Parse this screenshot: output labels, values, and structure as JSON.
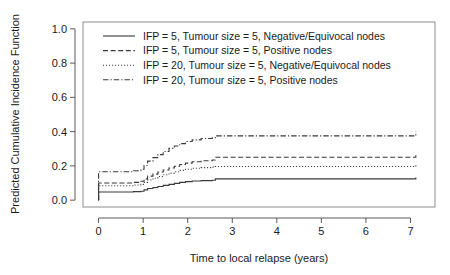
{
  "chart_data": {
    "type": "line",
    "title": "",
    "xlabel": "Time to local relapse (years)",
    "ylabel": "Predicted Cumulative Incidence Function",
    "xlim": [
      -0.35,
      7.55
    ],
    "ylim": [
      -0.04,
      1.04
    ],
    "xticks": [
      0,
      1,
      2,
      3,
      4,
      5,
      6,
      7
    ],
    "xtick_labels": [
      "0",
      "1",
      "2",
      "3",
      "4",
      "5",
      "6",
      "7"
    ],
    "yticks": [
      0.0,
      0.2,
      0.4,
      0.6,
      0.8,
      1.0
    ],
    "ytick_labels": [
      "0.0",
      "0.2",
      "0.4",
      "0.6",
      "0.8",
      "1.0"
    ],
    "grid": false,
    "legend_position": "top-left",
    "step_type": "post",
    "series": [
      {
        "name": "IFP = 5, Tumour size = 5, Negative/Equivocal nodes",
        "linestyle": "solid",
        "color": "#3a3a3a",
        "x": [
          0.0,
          0.0,
          0.62,
          0.78,
          0.95,
          1.02,
          1.1,
          1.22,
          1.33,
          1.45,
          1.58,
          1.7,
          1.82,
          1.95,
          2.1,
          2.3,
          2.55,
          2.62,
          3.4,
          4.5,
          5.6,
          6.6,
          7.05,
          7.12
        ],
        "y": [
          0.0,
          0.048,
          0.048,
          0.05,
          0.052,
          0.06,
          0.068,
          0.074,
          0.08,
          0.086,
          0.092,
          0.098,
          0.104,
          0.108,
          0.112,
          0.114,
          0.116,
          0.124,
          0.124,
          0.124,
          0.124,
          0.124,
          0.124,
          0.132
        ]
      },
      {
        "name": "IFP = 5, Tumour size = 5, Positive nodes",
        "linestyle": "dashed",
        "color": "#3a3a3a",
        "x": [
          0.0,
          0.0,
          0.62,
          0.78,
          0.95,
          1.02,
          1.1,
          1.22,
          1.33,
          1.45,
          1.58,
          1.7,
          1.82,
          1.95,
          2.1,
          2.3,
          2.55,
          2.62,
          3.4,
          4.5,
          5.6,
          6.6,
          7.05,
          7.12
        ],
        "y": [
          0.0,
          0.1,
          0.1,
          0.104,
          0.11,
          0.124,
          0.14,
          0.152,
          0.164,
          0.176,
          0.188,
          0.198,
          0.208,
          0.216,
          0.224,
          0.23,
          0.234,
          0.25,
          0.25,
          0.25,
          0.25,
          0.25,
          0.25,
          0.268
        ]
      },
      {
        "name": "IFP = 20, Tumour size = 5, Negative/Equivocal nodes",
        "linestyle": "dotted",
        "color": "#6a6a6a",
        "x": [
          0.0,
          0.0,
          0.62,
          0.78,
          0.95,
          1.02,
          1.1,
          1.22,
          1.33,
          1.45,
          1.58,
          1.7,
          1.82,
          1.95,
          2.1,
          2.3,
          2.55,
          2.62,
          3.4,
          4.5,
          5.6,
          6.6,
          7.05,
          7.12
        ],
        "y": [
          0.0,
          0.084,
          0.084,
          0.088,
          0.092,
          0.104,
          0.118,
          0.128,
          0.138,
          0.148,
          0.158,
          0.166,
          0.174,
          0.18,
          0.186,
          0.19,
          0.193,
          0.196,
          0.196,
          0.196,
          0.196,
          0.196,
          0.196,
          0.21
        ]
      },
      {
        "name": "IFP = 20, Tumour size = 5, Positive nodes",
        "linestyle": "dashdot",
        "color": "#3a3a3a",
        "x": [
          0.0,
          0.0,
          0.62,
          0.78,
          0.95,
          1.02,
          1.1,
          1.22,
          1.33,
          1.45,
          1.58,
          1.7,
          1.82,
          1.95,
          2.1,
          2.3,
          2.55,
          2.62,
          3.4,
          4.5,
          5.6,
          6.6,
          7.05,
          7.12
        ],
        "y": [
          0.0,
          0.166,
          0.166,
          0.172,
          0.18,
          0.202,
          0.228,
          0.248,
          0.266,
          0.284,
          0.302,
          0.316,
          0.33,
          0.342,
          0.352,
          0.36,
          0.364,
          0.375,
          0.375,
          0.375,
          0.375,
          0.375,
          0.375,
          0.4
        ]
      }
    ],
    "legend_entries": [
      {
        "label": "IFP = 5, Tumour size = 5, Negative/Equivocal nodes",
        "linestyle": "solid"
      },
      {
        "label": "IFP = 5, Tumour size = 5, Positive nodes",
        "linestyle": "dashed"
      },
      {
        "label": "IFP = 20, Tumour size = 5, Negative/Equivocal nodes",
        "linestyle": "dotted"
      },
      {
        "label": "IFP = 20, Tumour size = 5, Positive nodes",
        "linestyle": "dashdot"
      }
    ]
  }
}
